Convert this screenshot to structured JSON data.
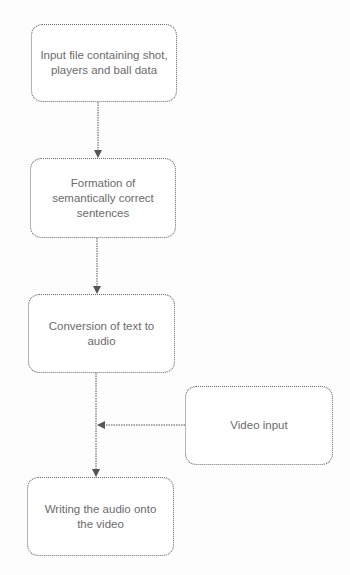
{
  "diagram": {
    "type": "flowchart",
    "colors": {
      "border": "#6a6a6a",
      "text": "#6b6b6b",
      "arrow": "#555555",
      "background": "#ffffff"
    },
    "nodes": [
      {
        "id": "input-file",
        "label": "Input file containing shot, players and ball data"
      },
      {
        "id": "sentence-formation",
        "label": "Formation of semantically correct sentences"
      },
      {
        "id": "text-to-audio",
        "label": "Conversion of text to audio"
      },
      {
        "id": "video-input",
        "label": "Video input"
      },
      {
        "id": "write-audio",
        "label": "Writing the audio onto the video"
      }
    ],
    "edges": [
      {
        "from": "input-file",
        "to": "sentence-formation"
      },
      {
        "from": "sentence-formation",
        "to": "text-to-audio"
      },
      {
        "from": "text-to-audio",
        "to": "write-audio"
      },
      {
        "from": "video-input",
        "to": "text-to-audio→write-audio connector"
      }
    ]
  }
}
